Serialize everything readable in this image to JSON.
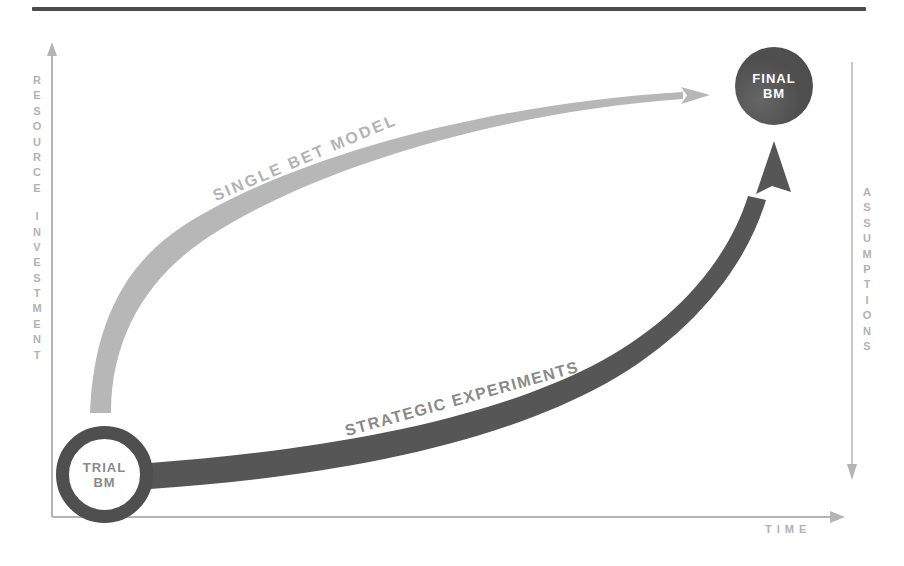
{
  "top_rule_color": "#4a4a4a",
  "axes": {
    "left_label": "RESOURCE INVESTMENT",
    "bottom_label": "TIME",
    "right_label": "ASSUMPTIONS",
    "axis_color": "#b4b4b4"
  },
  "curves": {
    "single_bet": {
      "label": "SINGLE BET MODEL",
      "color": "#b7b7b7",
      "label_color": "#b3b3b3"
    },
    "strategic": {
      "label": "STRATEGIC EXPERIMENTS",
      "color": "#565656",
      "label_color": "#8a8a8a"
    }
  },
  "nodes": {
    "trial": {
      "line1": "TRIAL",
      "line2": "BM",
      "ring_color": "#4f4f4f",
      "text_color": "#8a8a8a"
    },
    "final": {
      "line1": "FINAL",
      "line2": "BM",
      "fill": "#4f4f4f",
      "text_color": "#ffffff"
    }
  }
}
